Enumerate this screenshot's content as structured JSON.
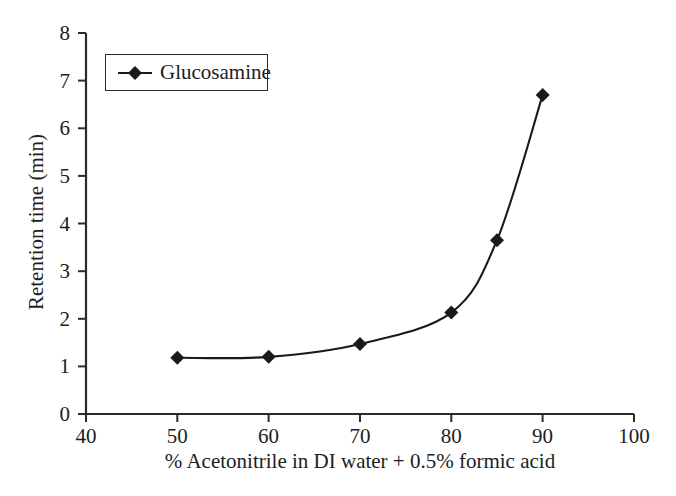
{
  "chart_data": {
    "type": "line",
    "title": "",
    "subtitle": "",
    "xlabel": "% Acetonitrile in DI water + 0.5% formic acid",
    "ylabel": "Retention time (min)",
    "xlim": [
      40,
      100
    ],
    "ylim": [
      0,
      8
    ],
    "xticks": [
      40,
      50,
      60,
      70,
      80,
      90,
      100
    ],
    "yticks": [
      0,
      1,
      2,
      3,
      4,
      5,
      6,
      7,
      8
    ],
    "xtick_labels": [
      "40",
      "50",
      "60",
      "70",
      "80",
      "90",
      "100"
    ],
    "ytick_labels": [
      "0",
      "1",
      "2",
      "3",
      "4",
      "5",
      "6",
      "7",
      "8"
    ],
    "grid": false,
    "legend_position": "upper-left",
    "x": [
      50,
      60,
      70,
      80,
      85,
      90
    ],
    "series": [
      {
        "name": "Glucosamine",
        "values": [
          1.18,
          1.2,
          1.47,
          2.13,
          3.65,
          6.7
        ],
        "marker": "diamond",
        "color": "#1a1a1a",
        "line_color": "#1a1a1a"
      }
    ],
    "annotations": []
  },
  "legend": {
    "entries": [
      {
        "label": "Glucosamine",
        "marker": "diamond-marker-icon",
        "color": "#1a1a1a"
      }
    ]
  },
  "axes": {
    "x_title": "% Acetonitrile in DI water + 0.5% formic acid",
    "y_title": "Retention time (min)"
  },
  "colors": {
    "background": "#ffffff",
    "axis": "#2b2b2b",
    "data": "#1a1a1a",
    "text": "#1d1d1d"
  }
}
